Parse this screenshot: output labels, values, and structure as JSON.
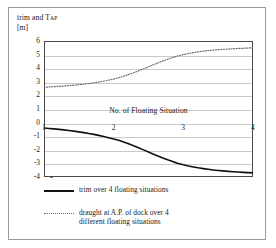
{
  "figure": {
    "background": "#ffffff",
    "frame_color": "#9a9a9a"
  },
  "axis": {
    "y_title_main": "trim and T",
    "y_title_sub": "AP",
    "y_unit": "[m]",
    "x_title": "No. of Floating Situation",
    "y_ticks": [
      "6",
      "5",
      "4",
      "3",
      "2",
      "1",
      "0",
      "-1",
      "-2",
      "-3",
      "-4"
    ],
    "x_ticks": [
      "1",
      "2",
      "3",
      "4"
    ]
  },
  "legend": {
    "items": [
      {
        "style": "solid",
        "color": "#111111",
        "label": "trim over 4 floating situations"
      },
      {
        "style": "dotted",
        "color": "#6e6e6e",
        "label_line1": "draught at A.P. of dock over 4",
        "label_line2": "different floating situations"
      }
    ]
  },
  "chart_data": {
    "type": "line",
    "title": "",
    "xlabel": "No. of Floating Situation",
    "ylabel": "trim and T_AP [m]",
    "xlim": [
      1,
      4
    ],
    "ylim": [
      -4,
      6
    ],
    "xticks": [
      1,
      2,
      3,
      4
    ],
    "yticks": [
      -4,
      -3,
      -2,
      -1,
      0,
      1,
      2,
      3,
      4,
      5,
      6
    ],
    "grid": "horizontal",
    "legend_position": "below",
    "x": [
      1,
      2,
      3,
      4
    ],
    "series": [
      {
        "name": "trim over 4 floating situations",
        "style": "solid",
        "color": "#111111",
        "values": [
          -0.4,
          -1.2,
          -3.1,
          -3.7
        ]
      },
      {
        "name": "draught at A.P. of dock over 4 different floating situations",
        "style": "dotted",
        "color": "#6e6e6e",
        "values": [
          2.6,
          3.2,
          5.0,
          5.5
        ]
      }
    ]
  }
}
